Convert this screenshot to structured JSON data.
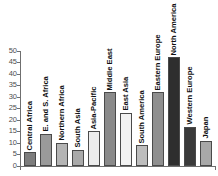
{
  "top_clipped_text": "· · · · · · · · ·",
  "chart_data": {
    "type": "bar",
    "title": "",
    "subtitle": "",
    "xlabel": "",
    "ylabel": "",
    "ylim": [
      0,
      50
    ],
    "ytick_step": 5,
    "grid": false,
    "legend": "none",
    "categories": [
      "Central Africa",
      "E. and S. Africa",
      "Northern Africa",
      "South Asia",
      "Asia-Pacific",
      "Middle East",
      "East Asia",
      "South America",
      "Eastern Europe",
      "North America",
      "Western Europe",
      "Japan"
    ],
    "values": [
      6,
      14,
      10,
      7,
      15,
      32,
      23,
      9,
      32,
      47,
      17,
      11
    ],
    "bar_colors": [
      "#7d7d7d",
      "#9a9a9a",
      "#b4b4b4",
      "#aaaaaa",
      "#ededed",
      "#8a8a8a",
      "#f2f2f2",
      "#bdbdbd",
      "#8f8f8f",
      "#2e2e2e",
      "#3a3a3a",
      "#a8a8a8"
    ],
    "ytick_labels": [
      "0",
      "5",
      "10",
      "15",
      "20",
      "25",
      "30",
      "35",
      "40",
      "45",
      "50"
    ],
    "ytick_values": [
      0,
      5,
      10,
      15,
      20,
      25,
      30,
      35,
      40,
      45,
      50
    ],
    "axis_color": "#6f6f6f",
    "bar_edge_color": "#4a4a4a",
    "label_color": "#111111"
  }
}
